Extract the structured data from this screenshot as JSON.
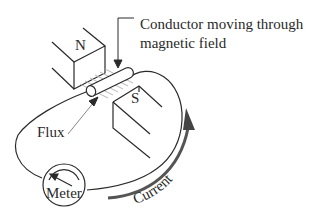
{
  "diagram": {
    "type": "generator principle illustration",
    "labels": {
      "conductor_line1": "Conductor moving through",
      "conductor_line2": "magnetic field",
      "north_pole": "N",
      "south_pole": "S",
      "flux": "Flux",
      "meter": "Meter",
      "current": "Current"
    },
    "icons": {
      "north_magnet": "magnet-pole-block",
      "south_magnet": "magnet-pole-block",
      "conductor": "cylinder-rod",
      "meter": "galvanometer-dial",
      "current_direction": "curved-arrow-up"
    },
    "colors": {
      "line": "#2a2a2a",
      "flux_lines": "#b8b8b8",
      "background": "#ffffff"
    }
  }
}
